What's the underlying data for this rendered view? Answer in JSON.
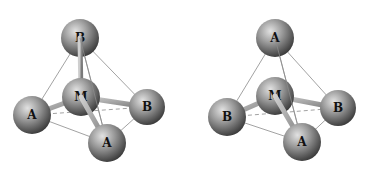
{
  "figure": {
    "colors": {
      "sphere_light": "#d8d8d8",
      "sphere_dark": "#4a4a4a",
      "bond": "#9a9a9a",
      "edge": "#8a8a8a"
    },
    "molecules": [
      {
        "id": "left",
        "center": {
          "label": "M",
          "x": 81,
          "y": 97
        },
        "atoms": [
          {
            "label": "B",
            "position": "top",
            "x": 80,
            "y": 38
          },
          {
            "label": "A",
            "position": "left",
            "x": 32,
            "y": 115
          },
          {
            "label": "B",
            "position": "right",
            "x": 147,
            "y": 107
          },
          {
            "label": "A",
            "position": "bottom",
            "x": 107,
            "y": 143
          }
        ]
      },
      {
        "id": "right",
        "center": {
          "label": "M",
          "x": 275,
          "y": 96
        },
        "atoms": [
          {
            "label": "A",
            "position": "top",
            "x": 275,
            "y": 38
          },
          {
            "label": "B",
            "position": "left",
            "x": 227,
            "y": 117
          },
          {
            "label": "B",
            "position": "right",
            "x": 338,
            "y": 108
          },
          {
            "label": "A",
            "position": "bottom",
            "x": 302,
            "y": 142
          }
        ]
      }
    ]
  }
}
